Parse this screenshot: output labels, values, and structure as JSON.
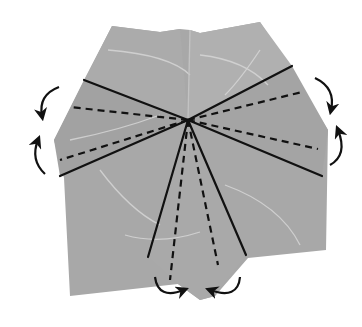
{
  "diagram": {
    "title": "Origami folding step",
    "description": "Grey folded paper with valley fold lines (dashed) and mountain fold lines (solid) radiating from a central point, with curved arrows indicating folding direction",
    "colors": {
      "background": "#ffffff",
      "paper": "#a8a8a8",
      "paper_light": "#bdbdbd",
      "paper_dark": "#9a9a9a",
      "vein": "#d8d8d8",
      "line": "#111111"
    },
    "center": [
      188,
      120
    ],
    "paper_outline": [
      [
        112,
        26
      ],
      [
        160,
        32
      ],
      [
        180,
        29
      ],
      [
        190,
        30
      ],
      [
        200,
        33
      ],
      [
        260,
        22
      ],
      [
        290,
        68
      ],
      [
        328,
        130
      ],
      [
        326,
        250
      ],
      [
        248,
        258
      ],
      [
        215,
        296
      ],
      [
        200,
        300
      ],
      [
        178,
        284
      ],
      [
        70,
        296
      ],
      [
        64,
        178
      ],
      [
        54,
        140
      ],
      [
        112,
        26
      ]
    ],
    "mountain_folds": [
      {
        "from": [
          188,
          120
        ],
        "to": [
          84,
          80
        ]
      },
      {
        "from": [
          188,
          120
        ],
        "to": [
          60,
          176
        ]
      },
      {
        "from": [
          188,
          120
        ],
        "to": [
          292,
          66
        ]
      },
      {
        "from": [
          188,
          120
        ],
        "to": [
          322,
          176
        ]
      },
      {
        "from": [
          188,
          120
        ],
        "to": [
          148,
          257
        ]
      },
      {
        "from": [
          188,
          120
        ],
        "to": [
          246,
          255
        ]
      }
    ],
    "valley_folds": [
      {
        "from": [
          188,
          120
        ],
        "to": [
          70,
          107
        ]
      },
      {
        "from": [
          188,
          120
        ],
        "to": [
          60,
          160
        ]
      },
      {
        "from": [
          188,
          120
        ],
        "to": [
          302,
          92
        ]
      },
      {
        "from": [
          188,
          120
        ],
        "to": [
          318,
          149
        ]
      },
      {
        "from": [
          188,
          120
        ],
        "to": [
          170,
          280
        ]
      },
      {
        "from": [
          188,
          120
        ],
        "to": [
          218,
          265
        ]
      }
    ],
    "arrows": [
      {
        "name": "left-upper-arrow",
        "direction": "down"
      },
      {
        "name": "left-lower-arrow",
        "direction": "up"
      },
      {
        "name": "right-upper-arrow",
        "direction": "down"
      },
      {
        "name": "right-lower-arrow",
        "direction": "up"
      },
      {
        "name": "bottom-left-arrow",
        "direction": "right"
      },
      {
        "name": "bottom-right-arrow",
        "direction": "left"
      }
    ]
  }
}
